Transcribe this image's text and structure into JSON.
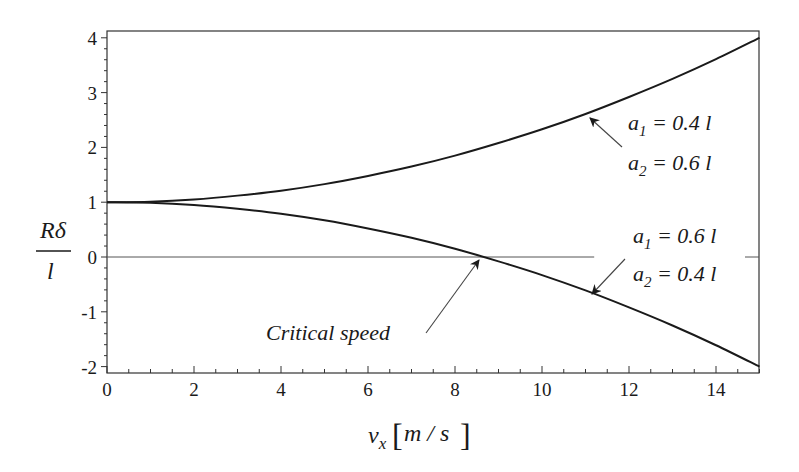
{
  "chart_data": {
    "type": "line",
    "title": "",
    "xlabel": "v_x [m/s]",
    "ylabel": "Rδ / l",
    "xlim": [
      0,
      15
    ],
    "ylim": [
      -2.1,
      4.12
    ],
    "grid": false,
    "legend": "none (inline annotations)",
    "x_ticks": [
      0,
      2,
      4,
      6,
      8,
      10,
      12,
      14
    ],
    "y_ticks": [
      -2,
      -1,
      0,
      1,
      2,
      3,
      4
    ],
    "x_tick_labels": [
      "0",
      "2",
      "4",
      "6",
      "8",
      "10",
      "12",
      "14"
    ],
    "y_tick_labels": [
      "-2",
      "-1",
      "0",
      "1",
      "2",
      "3",
      "4"
    ],
    "series": [
      {
        "name": "a1 = 0.4 l, a2 = 0.6 l",
        "x": [
          0,
          1,
          2,
          3,
          4,
          5,
          6,
          7,
          8,
          9,
          10,
          11,
          12,
          13,
          14,
          15
        ],
        "values": [
          1.0,
          1.01,
          1.05,
          1.12,
          1.21,
          1.33,
          1.48,
          1.65,
          1.85,
          2.08,
          2.33,
          2.61,
          2.92,
          3.25,
          3.61,
          4.0
        ]
      },
      {
        "name": "a1 = 0.6 l, a2 = 0.4 l",
        "x": [
          0,
          1,
          2,
          3,
          4,
          5,
          6,
          7,
          8,
          9,
          10,
          11,
          12,
          13,
          14,
          15
        ],
        "values": [
          1.0,
          0.99,
          0.95,
          0.88,
          0.79,
          0.67,
          0.52,
          0.35,
          0.15,
          -0.08,
          -0.33,
          -0.61,
          -0.92,
          -1.25,
          -1.61,
          -2.0
        ]
      },
      {
        "name": "zero reference line",
        "x": [
          0,
          11.2
        ],
        "values": [
          0,
          0
        ]
      }
    ],
    "annotations": [
      {
        "text_parts": [
          "a",
          "1",
          " = 0.4 l"
        ],
        "subscripted": "a_1 = 0.4 l",
        "points_to": {
          "x": 11.0,
          "y": 2.55
        }
      },
      {
        "text_parts": [
          "a",
          "2",
          " = 0.6 l"
        ],
        "subscripted": "a_2 = 0.6 l"
      },
      {
        "text_parts": [
          "a",
          "1",
          " = 0.6 l"
        ],
        "subscripted": "a_1 = 0.6 l"
      },
      {
        "text_parts": [
          "a",
          "2",
          " = 0.4 l"
        ],
        "subscripted": "a_2 = 0.4 l",
        "points_to": {
          "x": 11.3,
          "y": -0.72
        }
      },
      {
        "text": "Critical speed",
        "points_to": {
          "x": 8.66,
          "y": 0
        }
      }
    ],
    "critical_speed": 8.66
  },
  "labels": {
    "xlabel_main": "v",
    "xlabel_sub": "x",
    "xlabel_unit": "m / s",
    "ylabel_num": "Rδ",
    "ylabel_den": "l",
    "ann1_line1_a": "a",
    "ann1_line1_sub": "1",
    "ann1_line1_rest": " = 0.4 l",
    "ann1_line2_a": "a",
    "ann1_line2_sub": "2",
    "ann1_line2_rest": " = 0.6 l",
    "ann2_line1_a": "a",
    "ann2_line1_sub": "1",
    "ann2_line1_rest": " = 0.6 l",
    "ann2_line2_a": "a",
    "ann2_line2_sub": "2",
    "ann2_line2_rest": " = 0.4 l",
    "critical": "Critical speed"
  },
  "colors": {
    "curve": "#1a1a1a",
    "axis": "#333333",
    "zero_line": "#555555",
    "arrow": "#444444"
  }
}
